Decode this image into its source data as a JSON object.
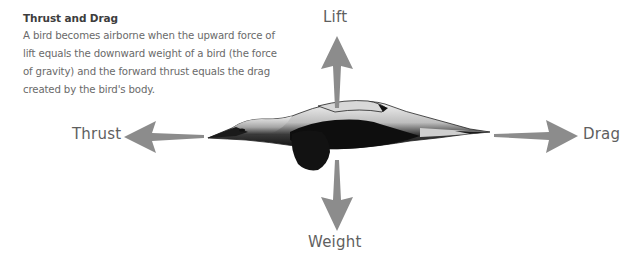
{
  "description": {
    "title": "Thrust and Drag",
    "body": "A bird becomes airborne when the upward force of lift equals the downward weight of a bird (the force of gravity) and the forward thrust equals the drag created by the bird's body."
  },
  "forces": {
    "lift": {
      "label": "Lift",
      "direction": "up",
      "icon": "arrow-up-icon"
    },
    "thrust": {
      "label": "Thrust",
      "direction": "left",
      "icon": "arrow-left-icon"
    },
    "drag": {
      "label": "Drag",
      "direction": "right",
      "icon": "arrow-right-icon"
    },
    "weight": {
      "label": "Weight",
      "direction": "down",
      "icon": "arrow-down-icon"
    }
  },
  "colors": {
    "arrow": "#8c8c8c",
    "label_text": "#5f5f5f",
    "bird_dark": "#111111",
    "bird_light": "#e8e8e8"
  }
}
